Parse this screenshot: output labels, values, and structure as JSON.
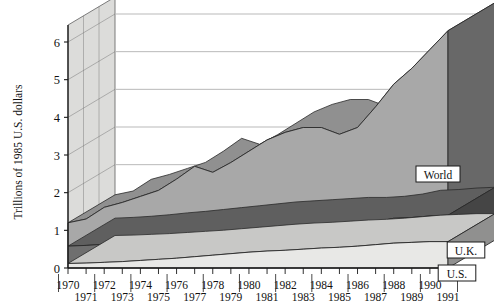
{
  "chart_data": {
    "type": "area",
    "stacked": true,
    "projection": "3d",
    "title": "",
    "subtitle": "",
    "xlabel": "",
    "ylabel": "Trillions of 1985 U.S. dollars",
    "ylim": [
      0,
      6.6
    ],
    "yticks": [
      0,
      1,
      2,
      3,
      4,
      5,
      6
    ],
    "ytick_labels": [
      "0",
      "1",
      "2",
      "3",
      "4",
      "5",
      "6"
    ],
    "grid": true,
    "legend_position": "inline-callouts",
    "x": [
      1970,
      1971,
      1972,
      1973,
      1974,
      1975,
      1976,
      1977,
      1978,
      1979,
      1980,
      1981,
      1982,
      1983,
      1984,
      1985,
      1986,
      1987,
      1988,
      1989,
      1990,
      1991
    ],
    "xtick_labels_even": [
      "1970",
      "1972",
      "1974",
      "1976",
      "1978",
      "1980",
      "1982",
      "1984",
      "1986",
      "1988",
      "1990"
    ],
    "xtick_labels_odd": [
      "1971",
      "1973",
      "1975",
      "1977",
      "1979",
      "1981",
      "1983",
      "1985",
      "1987",
      "1989",
      "1991"
    ],
    "series": [
      {
        "name": "U.S.",
        "color": "#e8e8e6",
        "values": [
          0.12,
          0.13,
          0.15,
          0.17,
          0.2,
          0.23,
          0.26,
          0.3,
          0.34,
          0.38,
          0.42,
          0.45,
          0.47,
          0.5,
          0.53,
          0.55,
          0.58,
          0.62,
          0.66,
          0.68,
          0.7,
          0.7
        ]
      },
      {
        "name": "U.K.",
        "color": "#6f6f6f",
        "values": [
          0.46,
          0.47,
          0.48,
          0.5,
          0.52,
          0.53,
          0.55,
          0.56,
          0.57,
          0.58,
          0.59,
          0.59,
          0.6,
          0.6,
          0.6,
          0.58,
          0.58,
          0.6,
          0.66,
          0.66,
          0.68,
          0.7
        ]
      },
      {
        "name": "World",
        "color": "#a8a8a8",
        "values": [
          0.62,
          0.7,
          0.98,
          1.07,
          1.18,
          1.3,
          1.55,
          1.84,
          1.63,
          1.84,
          2.09,
          2.36,
          2.53,
          2.63,
          2.6,
          2.42,
          2.57,
          3.06,
          3.56,
          3.96,
          4.42,
          4.9
        ]
      }
    ],
    "totals": [
      1.2,
      1.3,
      1.61,
      1.74,
      1.9,
      2.06,
      2.36,
      2.7,
      2.54,
      2.8,
      3.1,
      3.4,
      3.6,
      3.73,
      3.73,
      3.55,
      3.73,
      4.28,
      4.88,
      5.3,
      5.8,
      6.3
    ],
    "callouts": [
      {
        "label": "World",
        "series": "World"
      },
      {
        "label": "U.K.",
        "series": "U.K."
      },
      {
        "label": "U.S.",
        "series": "U.S."
      }
    ]
  },
  "style": {
    "wall_fill": "#dcdcda",
    "wall_edge": "#6e6e6e",
    "gridline": "#b9b9b9",
    "axis_line": "#1a1a1a",
    "series_edge": "#2a2a2a",
    "callout_bg": "#ffffff",
    "callout_border": "#1a1a1a",
    "page_bg": "#ffffff"
  }
}
